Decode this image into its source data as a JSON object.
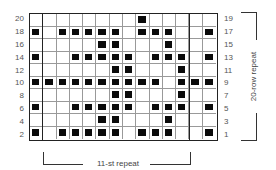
{
  "chart": {
    "columns": 14,
    "rows": 10,
    "thick_lines_after_columns": [
      1,
      12
    ],
    "left_labels": [
      "20",
      "18",
      "16",
      "14",
      "12",
      "10",
      "8",
      "6",
      "4",
      "2"
    ],
    "right_labels": [
      "19",
      "17",
      "15",
      "13",
      "11",
      "9",
      "7",
      "5",
      "3",
      "1"
    ],
    "filled": [
      [
        9
      ],
      [
        1,
        3,
        4,
        5,
        6,
        7,
        9,
        10,
        11,
        14
      ],
      [
        6,
        7,
        11
      ],
      [
        1,
        4,
        5,
        6,
        7,
        8,
        10,
        11,
        12,
        14
      ],
      [
        7,
        8,
        12
      ],
      [
        1,
        2,
        3,
        4,
        5,
        6,
        7,
        8,
        9,
        10,
        12,
        13,
        14
      ],
      [
        7,
        8,
        12
      ],
      [
        1,
        4,
        5,
        6,
        7,
        8,
        10,
        11,
        12,
        14
      ],
      [
        6,
        7,
        11
      ],
      [
        1,
        3,
        4,
        5,
        6,
        7,
        9,
        10,
        11,
        14
      ]
    ],
    "fill_color": "#0a0a0a"
  },
  "labels": {
    "stitch_repeat": "11-st repeat",
    "row_repeat": "20-row repeat"
  }
}
